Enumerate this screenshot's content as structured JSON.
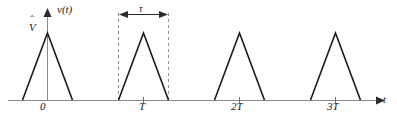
{
  "figure": {
    "kind": "waveform-plot",
    "background": "#ffffff",
    "stroke_color": "#1a1a1a",
    "axis_color": "#8a8a8a",
    "dash_color": "#8a8a8a",
    "labels": {
      "y_axis": "v(t)",
      "amplitude": "V",
      "pulse_width": "τ",
      "origin": "0",
      "tick_T": "T",
      "tick_2T": "2T",
      "tick_3T": "3T",
      "x_axis": "t"
    }
  },
  "chart_data": {
    "type": "line",
    "title": "",
    "xlabel": "t",
    "ylabel": "v(t)",
    "xlim": [
      -0.5,
      3.6
    ],
    "ylim": [
      0,
      1.15
    ],
    "grid": false,
    "legend": null,
    "annotations": [
      {
        "text": "V",
        "role": "amplitude-label",
        "x": -0.12,
        "y": 1.0,
        "accent": "hat"
      },
      {
        "text": "τ",
        "role": "pulse-width-dimension",
        "x": 1.0,
        "y": 1.2,
        "span": [
          0.74,
          1.26
        ],
        "style": "double-headed-arrow"
      }
    ],
    "xticks": [
      0,
      1,
      2,
      3
    ],
    "xticklabels": [
      "0",
      "T",
      "2T",
      "3T"
    ],
    "yticks": [],
    "yticklabels": [],
    "series": [
      {
        "name": "v(t)",
        "color": "#1a1a1a",
        "x": [
          -0.5,
          -0.26,
          0.0,
          0.26,
          0.74,
          1.0,
          1.26,
          1.74,
          2.0,
          2.26,
          2.74,
          3.0,
          3.26,
          3.6
        ],
        "y": [
          0,
          0,
          1,
          0,
          0,
          1,
          0,
          0,
          1,
          0,
          0,
          1,
          0,
          0
        ]
      }
    ],
    "pulses": [
      {
        "center": 0,
        "peak": 1,
        "half_width": 0.26
      },
      {
        "center": 1,
        "peak": 1,
        "half_width": 0.26
      },
      {
        "center": 2,
        "peak": 1,
        "half_width": 0.26
      },
      {
        "center": 3,
        "peak": 1,
        "half_width": 0.26
      }
    ],
    "dashed_guides": [
      {
        "x": 0.74,
        "y_from": 0,
        "y_to": 1.2
      },
      {
        "x": 1.26,
        "y_from": 0,
        "y_to": 1.2
      }
    ]
  }
}
